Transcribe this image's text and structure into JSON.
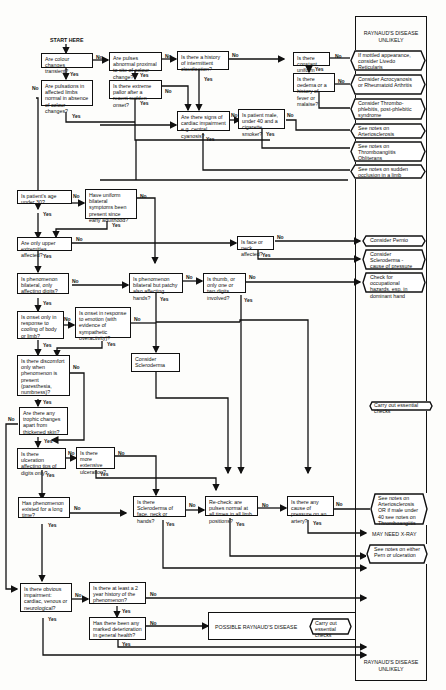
{
  "start_label": "START HERE",
  "panel": {
    "top_title": "RAYNAUD'S DISEASE UNLIKELY",
    "bottom_title": "RAYNAUD'S DISEASE UNLIKELY",
    "may_need_xray": "MAY NEED X-RAY"
  },
  "questions": {
    "q1": "Are colour changes transient?",
    "q2": "Are pulses abnormal proximal to site of colour change?",
    "q3": "Is there a history of intermittent claudication?",
    "q4": "Is there constant uniform cyanosis?",
    "q5": "Is there oedema or a history of fever or malaise?",
    "q6": "Are pulsations in affected limbs normal in absence of colour changes?",
    "q7": "Is there extreme pallor after a recent sudden onset?",
    "q8": "Are there signs of cardiac impairment e.g. central cyanosis?",
    "q9": "Is patient male, under 40 and a cigarette smoker?",
    "q10": "Is patient's age under 30?",
    "q11": "Have uniform bilateral symptoms been present since early adulthood?",
    "q12": "Are only upper extremities affected?",
    "q13": "Is face or neck affected?",
    "q14": "Is phenomenon bilateral, only affecting digits?",
    "q15": "Is phenomenon bilateral but patchy also affecting hands?",
    "q16": "Is thumb, or only one or two digits involved?",
    "q17": "Is onset only in response to cooling of body or limb?",
    "q18": "Is onset in response to emotion (with evidence of sympathetic overactivity)?",
    "q19": "Is there discomfort only when phenomenon is present (paresthesia, numbness)?",
    "q20": "Are there any trophic changes apart from thickened skin?",
    "q21": "Is there ulceration affecting tips of digits only?",
    "q22": "Is there more extensive ulceration?",
    "q23": "Has phenomenon existed for a long time?",
    "q24": "Is there Scleroderma of face, neck or hands?",
    "q25": "Re-check: are pulses normal at all times in all limb positions?",
    "q26": "Is there any cause of pressure on an artery?",
    "q27": "Is there obvious impairment: cardiac, venous or neurological?",
    "q28": "Is there at least a 2 year history of the phenomenon?",
    "q29": "Has there been any marked deterioration in general health?",
    "consider_scleroderma": "Consider Scleroderma",
    "possible_raynauds": "POSSIBLE RAYNAUD'S DISEASE"
  },
  "outcomes": {
    "o1": "If mottled appearance, consider Livedo Reticularis",
    "o2": "Consider Acrocyanosis or Rheumatoid Arthritis",
    "o3": "Consider Thrombo-phlebitis, post-phlebitic syndrome",
    "o4": "See notes on Arteriosclerosis",
    "o5": "See notes on Thromboangiitis Obliterans",
    "o6": "See notes on sudden occlusion in a limb",
    "o7": "Consider Pernio",
    "o8": "Consider Scleroderma - cause of pressure on an artery",
    "o9": "Check for occupational hazards, esp. in dominant hand",
    "o10": "Carry out essential checks",
    "o11": "See notes on Arteriosclerosis OR if male under 40 see notes on Thromboangiitis",
    "o12": "See notes on either Pern or ulceration",
    "o13": "Carry out essential checks"
  },
  "labels": {
    "yes": "Yes",
    "no": "No"
  }
}
